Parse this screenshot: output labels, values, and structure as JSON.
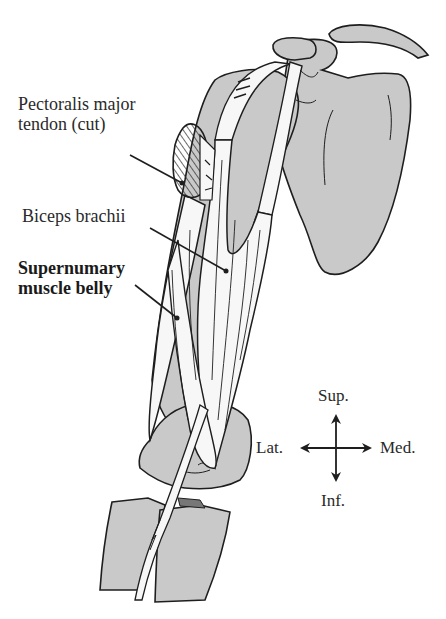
{
  "figure": {
    "colors": {
      "background": "#ffffff",
      "bone_fill": "#c9c9c9",
      "outline": "#1e1e1e",
      "muscle_fill": "#f7f7f7",
      "text": "#2a2a2a"
    },
    "labels": [
      {
        "id": "pectoralis",
        "lines": [
          "Pectoralis major",
          "tendon (cut)"
        ],
        "bold": false
      },
      {
        "id": "biceps",
        "lines": [
          "Biceps brachii"
        ],
        "bold": false
      },
      {
        "id": "supernumary",
        "lines": [
          "Supernumary",
          "muscle belly"
        ],
        "bold": true
      }
    ],
    "compass": {
      "up": "Sup.",
      "down": "Inf.",
      "left": "Lat.",
      "right": "Med."
    }
  }
}
